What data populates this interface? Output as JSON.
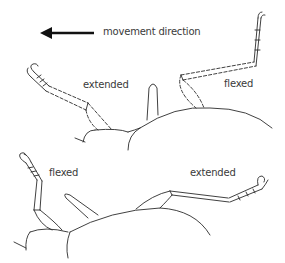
{
  "legend": {
    "arrow_icon": "left-arrow",
    "text": "movement direction"
  },
  "top_panel": {
    "left_leg_label": "extended",
    "right_leg_label": "flexed",
    "leg_style": "dashed"
  },
  "bottom_panel": {
    "left_leg_label": "flexed",
    "right_leg_label": "extended",
    "leg_style": "solid"
  },
  "colors": {
    "line": "#2b2b2b",
    "text": "#3a3a3a",
    "background": "#ffffff"
  }
}
